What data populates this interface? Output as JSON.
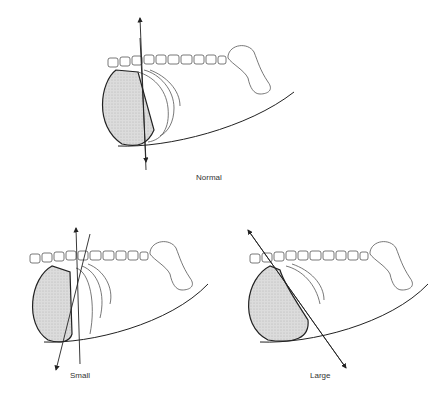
{
  "figure": {
    "panels": [
      {
        "id": "normal",
        "label": "Normal",
        "axis": "vertical"
      },
      {
        "id": "small",
        "label": "Small",
        "axis": "tilted-forward"
      },
      {
        "id": "large",
        "label": "Large",
        "axis": "tilted-backward"
      }
    ],
    "colors": {
      "ink": "#333333",
      "shade": "#d6d6d6",
      "background": "#ffffff"
    }
  }
}
